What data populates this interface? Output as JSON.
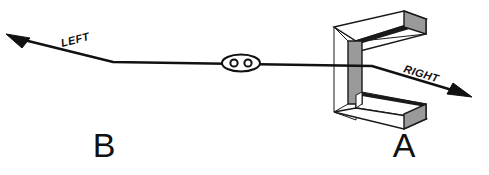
{
  "figure": {
    "background_color": "#ffffff",
    "width": 489,
    "height": 175
  },
  "colors": {
    "line": "#111111",
    "outline": "#1a1a1a",
    "face_gray": "#9a9a9a",
    "face_gray_dark": "#8b8b8b",
    "white": "#ffffff",
    "text": "#111111"
  },
  "labels": {
    "left_direction": "LEFT",
    "right_direction": "RIGHT",
    "object_a": "A",
    "object_b": "B"
  },
  "annotations": {
    "observer_name": "eyes-symbol",
    "object_a_name": "c-shaped-bracket",
    "object_b_name": "position-b-label"
  },
  "geometry": {
    "path_points": "8,35 113,62 372,66 470,96",
    "left_arrow_tip": [
      8,
      35
    ],
    "right_arrow_tip": [
      470,
      96
    ],
    "observer_center": [
      241,
      63
    ],
    "left_label_angle": -14.5,
    "right_label_angle": 17.0
  }
}
